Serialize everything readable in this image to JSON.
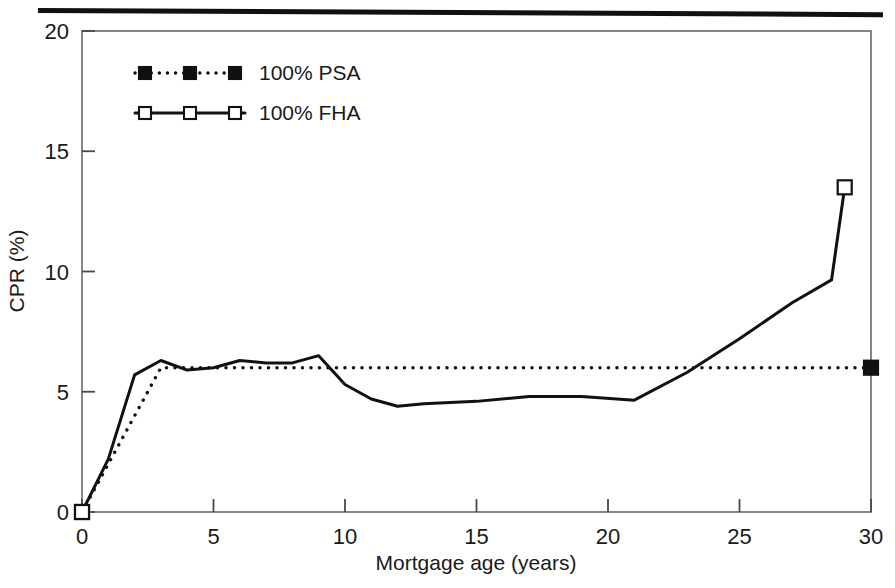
{
  "figure": {
    "rule_color": "#111111",
    "background": "#ffffff",
    "axis_color": "#555555",
    "series_color": "#111111"
  },
  "chart_data": {
    "type": "line",
    "title": "",
    "subtitle": "",
    "xlabel": "Mortgage age (years)",
    "ylabel": "CPR (%)",
    "xlim": [
      0,
      30
    ],
    "ylim": [
      0,
      20
    ],
    "xticks": [
      0,
      5,
      10,
      15,
      20,
      25,
      30
    ],
    "xtick_labels": [
      "0",
      "5",
      "10",
      "15",
      "20",
      "25",
      "30"
    ],
    "yticks": [
      0,
      5,
      10,
      15,
      20
    ],
    "ytick_labels": [
      "0",
      "5",
      "10",
      "15",
      "20"
    ],
    "grid": false,
    "legend_position": "top-left-inside",
    "series": [
      {
        "name": "100% PSA",
        "style": "dotted",
        "marker": "filled-square",
        "marker_at_ends": true,
        "x": [
          0,
          0.5,
          1,
          1.5,
          2,
          2.5,
          3,
          3.5,
          4,
          5,
          6,
          8,
          10,
          15,
          20,
          25,
          30
        ],
        "values": [
          0.0,
          1.0,
          2.0,
          3.0,
          4.0,
          5.0,
          6.0,
          6.0,
          6.0,
          6.0,
          6.0,
          6.0,
          6.0,
          6.0,
          6.0,
          6.0,
          6.0
        ]
      },
      {
        "name": "100% FHA",
        "style": "solid",
        "marker": "open-square",
        "marker_at_ends": true,
        "x": [
          0,
          1,
          2,
          3,
          4,
          5,
          6,
          7,
          8,
          9,
          10,
          11,
          12,
          13,
          15,
          17,
          19,
          21,
          23,
          25,
          27,
          28.5,
          29
        ],
        "values": [
          0.0,
          2.2,
          5.7,
          6.3,
          5.9,
          6.0,
          6.3,
          6.2,
          6.2,
          6.5,
          5.3,
          4.7,
          4.4,
          4.5,
          4.6,
          4.8,
          4.8,
          4.65,
          5.8,
          7.2,
          8.7,
          9.65,
          13.5
        ]
      }
    ],
    "annotations": []
  },
  "legend": {
    "entries": [
      {
        "label": "100% PSA",
        "marker": "filled-square",
        "line": "dotted"
      },
      {
        "label": "100% FHA",
        "marker": "open-square",
        "line": "solid"
      }
    ]
  }
}
